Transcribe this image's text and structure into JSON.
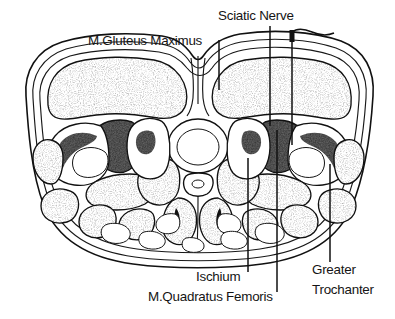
{
  "figure": {
    "kind": "anatomical-line-drawing",
    "orientation": "axial",
    "background_color": "#ffffff",
    "ink_color": "#111111",
    "text_color": "#151515",
    "muscle_fill": "stippled-gray",
    "bone_fill": "#ffffff",
    "fat_fill": "#ffffff"
  },
  "labels": {
    "gluteus_maximus": "M.Gluteus Maximus",
    "sciatic_nerve": "Sciatic Nerve",
    "ischium": "Ischium",
    "quadratus_femoris": "M.Quadratus Femoris",
    "greater_trochanter_line1": "Greater",
    "greater_trochanter_line2": "Trochanter"
  },
  "structures": [
    {
      "name": "skin-and-subcutaneous-fat",
      "label": "",
      "fill": "white"
    },
    {
      "name": "gluteus-maximus-left",
      "label": "M.Gluteus Maximus",
      "fill": "stipple"
    },
    {
      "name": "gluteus-maximus-right",
      "label": "M.Gluteus Maximus",
      "fill": "stipple"
    },
    {
      "name": "sciatic-nerve-right",
      "label": "Sciatic Nerve",
      "fill": "dark"
    },
    {
      "name": "sciatic-nerve-left",
      "label": "Sciatic Nerve",
      "fill": "dark"
    },
    {
      "name": "greater-trochanter-right",
      "label": "Greater Trochanter",
      "fill": "bone-trabecular"
    },
    {
      "name": "greater-trochanter-left",
      "label": "Greater Trochanter",
      "fill": "bone-trabecular"
    },
    {
      "name": "ischium-right",
      "label": "Ischium",
      "fill": "bone-trabecular"
    },
    {
      "name": "ischium-left",
      "label": "Ischium",
      "fill": "bone-trabecular"
    },
    {
      "name": "quadratus-femoris-right",
      "label": "M.Quadratus Femoris",
      "fill": "stipple"
    },
    {
      "name": "quadratus-femoris-left",
      "label": "M.Quadratus Femoris",
      "fill": "stipple"
    },
    {
      "name": "rectum",
      "label": "",
      "fill": "white"
    },
    {
      "name": "coccyx",
      "label": "",
      "fill": "white"
    },
    {
      "name": "gluteal-cleft",
      "label": "",
      "fill": "white"
    }
  ]
}
